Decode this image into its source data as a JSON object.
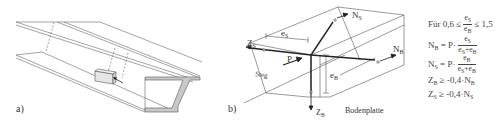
{
  "figure": {
    "language": "de",
    "panel_a": {
      "label": "a)"
    },
    "panel_b": {
      "label": "b)",
      "labels": {
        "e_s": "e",
        "e_s_sub": "S",
        "e_b": "e",
        "e_b_sub": "B",
        "z_s": "Z",
        "z_s_sub": "S",
        "z_b": "Z",
        "z_b_sub": "B",
        "n_s": "N",
        "n_s_sub": "S",
        "n_b": "N",
        "n_b_sub": "B",
        "p": "P",
        "steg": "Steg",
        "bodenplatte": "Bodenplatte"
      }
    },
    "formulas": {
      "condition": {
        "prefix": "Für 0,6 ≤",
        "num": "e",
        "num_sub": "S",
        "den": "e",
        "den_sub": "B",
        "suffix": "≤ 1,5"
      },
      "nb": {
        "lhs": "N",
        "lhs_sub": "B",
        "eq": "= P·",
        "num": "e",
        "num_sub": "S",
        "den": "e",
        "den_sub": "S",
        "den_plus": "+e",
        "den_sub2": "B"
      },
      "ns": {
        "lhs": "N",
        "lhs_sub": "S",
        "eq": "= P·",
        "num": "e",
        "num_sub": "B",
        "den": "e",
        "den_sub": "S",
        "den_plus": "+e",
        "den_sub2": "B"
      },
      "zb": {
        "lhs": "Z",
        "lhs_sub": "B",
        "rhs": "≥ -0,4·N",
        "rhs_sub": "B"
      },
      "zs": {
        "lhs": "Z",
        "lhs_sub": "S",
        "rhs": "≥ -0,4·N",
        "rhs_sub": "S"
      }
    },
    "colors": {
      "line": "#555555",
      "thick_line": "#222222",
      "section_fill": "#c8c8c8",
      "box_fill": "#e6e6e6"
    }
  }
}
